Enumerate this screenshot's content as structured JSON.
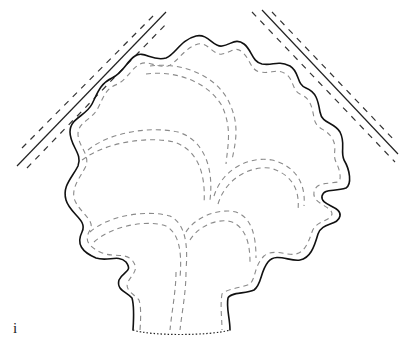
{
  "figure": {
    "label": "i",
    "type": "patent design line drawing"
  },
  "colors": {
    "outline": "#111111",
    "inner_dashed": "#8a8a8a",
    "background": "#ffffff"
  }
}
